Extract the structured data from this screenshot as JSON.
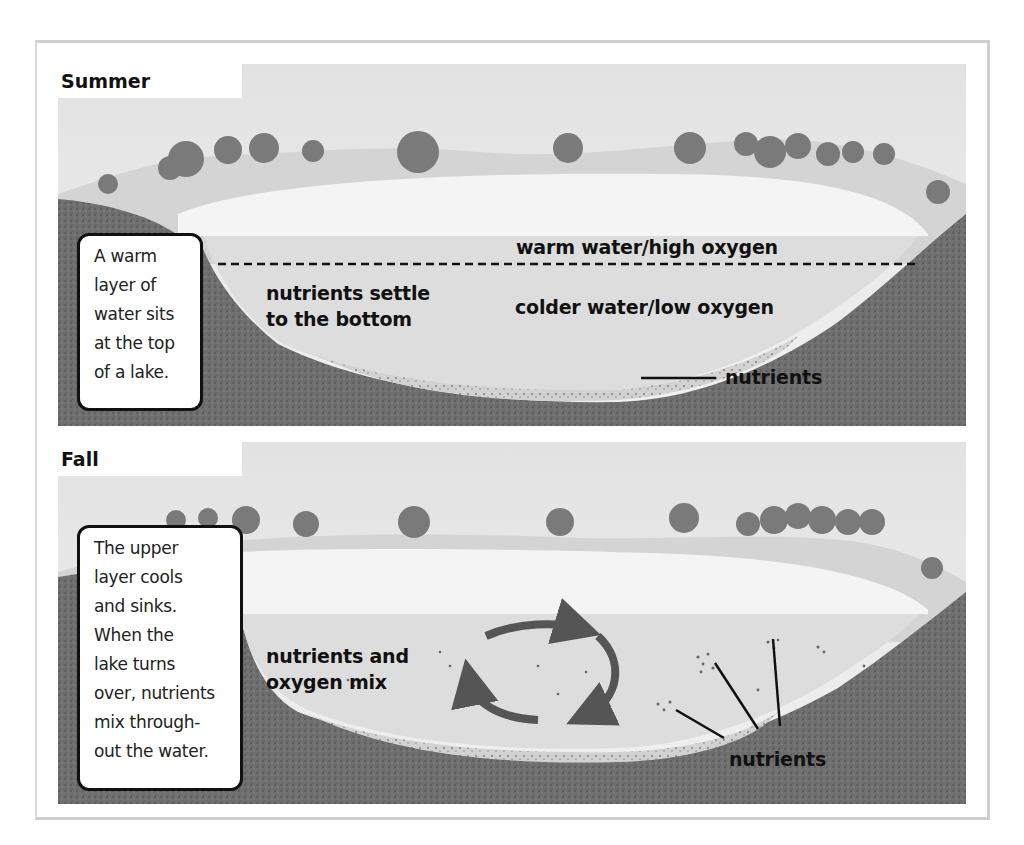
{
  "figure": {
    "colors": {
      "sky": "#ebebeb",
      "water_surface": "#f5f5f5",
      "water_body": "#dedede",
      "ground": "#6e6e6e",
      "arrow": "#555555",
      "text": "#111111",
      "callout_border": "#111111"
    }
  },
  "panels": [
    {
      "season": "Summer",
      "callout": "A warm\nlayer of\nwater sits\nat the top\nof a lake.",
      "labels": {
        "upper_layer": "warm water/high oxygen",
        "lower_layer": "colder water/low oxygen",
        "settle": "nutrients settle\nto the bottom",
        "nutrients": "nutrients"
      },
      "divider": "dashed thermocline line"
    },
    {
      "season": "Fall",
      "callout": "The upper\nlayer cools\nand sinks.\nWhen the\nlake turns\nover, nutrients\nmix through-\nout the water.",
      "labels": {
        "mix": "nutrients and\noxygen mix",
        "nutrients": "nutrients"
      },
      "icons": [
        "circular-arrows-icon"
      ]
    }
  ]
}
